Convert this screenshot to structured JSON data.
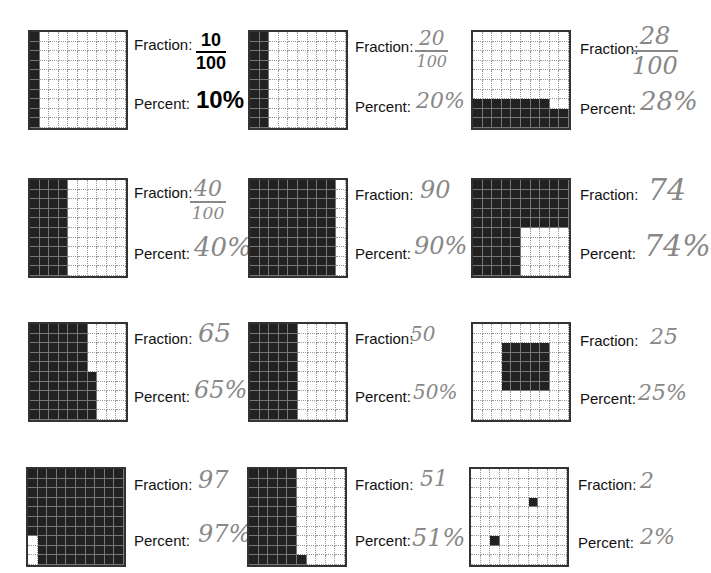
{
  "labels": {
    "fraction": "Fraction:",
    "percent": "Percent:"
  },
  "items": [
    {
      "fraction_num": "10",
      "fraction_den": "100",
      "percent": "10%",
      "shaded": 10,
      "style": "print"
    },
    {
      "fraction_num": "20",
      "fraction_den": "100",
      "percent": "20%",
      "shaded": 20,
      "style": "hand"
    },
    {
      "fraction_num": "28",
      "fraction_den": "100",
      "percent": "28%",
      "shaded": 28,
      "style": "hand"
    },
    {
      "fraction_num": "40",
      "fraction_den": "100",
      "percent": "40%",
      "shaded": 40,
      "style": "hand"
    },
    {
      "fraction_num": "90",
      "fraction_den": "",
      "percent": "90%",
      "shaded": 90,
      "style": "hand"
    },
    {
      "fraction_num": "74",
      "fraction_den": "",
      "percent": "74%",
      "shaded": 74,
      "style": "hand"
    },
    {
      "fraction_num": "65",
      "fraction_den": "",
      "percent": "65%",
      "shaded": 65,
      "style": "hand"
    },
    {
      "fraction_num": "50",
      "fraction_den": "",
      "percent": "50%",
      "shaded": 50,
      "style": "hand"
    },
    {
      "fraction_num": "25",
      "fraction_den": "",
      "percent": "25%",
      "shaded": 25,
      "style": "hand"
    },
    {
      "fraction_num": "97",
      "fraction_den": "",
      "percent": "97%",
      "shaded": 97,
      "style": "hand"
    },
    {
      "fraction_num": "51",
      "fraction_den": "",
      "percent": "51%",
      "shaded": 51,
      "style": "hand"
    },
    {
      "fraction_num": "2",
      "fraction_den": "",
      "percent": "2%",
      "shaded": 2,
      "style": "hand"
    }
  ]
}
